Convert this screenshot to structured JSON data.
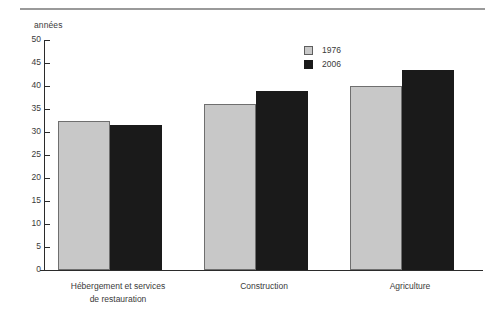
{
  "chart_data": {
    "type": "bar",
    "title": "",
    "subtitle": "",
    "xlabel": "",
    "ylabel": "années",
    "ylim": [
      0,
      50
    ],
    "ytick_step": 5,
    "yticks": [
      50,
      45,
      40,
      35,
      30,
      25,
      20,
      15,
      10,
      5,
      0
    ],
    "ytick_labels": [
      "50",
      "45",
      "40",
      "35",
      "30",
      "25",
      "20",
      "15",
      "10",
      "5",
      "0"
    ],
    "grid": false,
    "legend_position": "top-right",
    "categories": [
      "Hébergement et services\nde restauration",
      "Construction",
      "Agriculture"
    ],
    "series": [
      {
        "name": "1976",
        "color": "#c8c8c8",
        "values": [
          32.5,
          36.0,
          40.0
        ]
      },
      {
        "name": "2006",
        "color": "#1a1a1a",
        "values": [
          31.5,
          39.0,
          43.5
        ]
      }
    ],
    "annotations": []
  },
  "legend": {
    "entries": [
      {
        "label": "1976"
      },
      {
        "label": "2006"
      }
    ]
  },
  "colors": {
    "series_1976": "#c8c8c8",
    "series_2006": "#1a1a1a",
    "axis": "#2b2b2b",
    "text": "#3a3a3a",
    "rule": "#9a9a9a",
    "background": "#ffffff"
  }
}
